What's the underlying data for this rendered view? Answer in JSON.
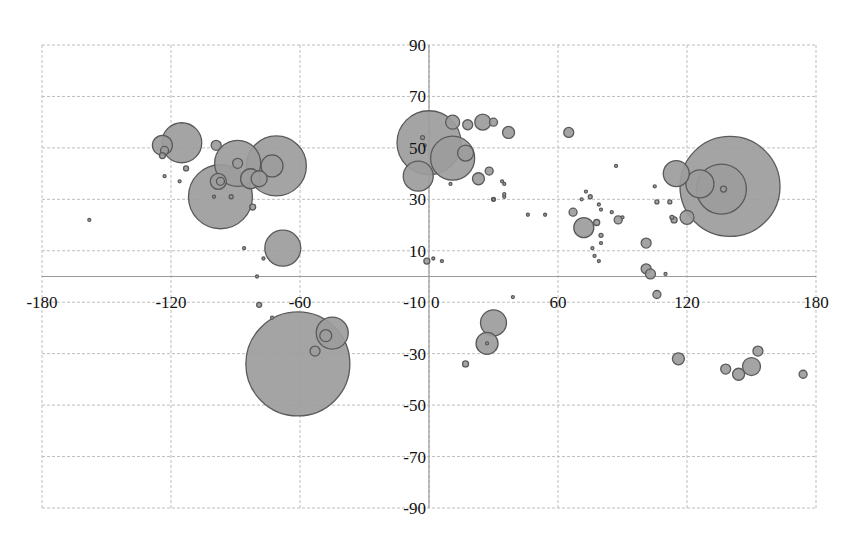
{
  "chart_data": {
    "type": "bubble",
    "title": "",
    "xlabel": "",
    "ylabel": "",
    "xlim": [
      -180,
      180
    ],
    "ylim": [
      -90,
      90
    ],
    "x_ticks": [
      -180,
      -120,
      -60,
      0,
      60,
      120,
      180
    ],
    "y_ticks": [
      90,
      70,
      50,
      30,
      10,
      -10,
      -30,
      -50,
      -70,
      -90
    ],
    "grid": true,
    "legend": null,
    "colors": {
      "bubble_fill": "#9c9c9c",
      "bubble_border": "#5a5a5a",
      "grid": "#bdbdbd"
    },
    "size_unit": "radius_px",
    "points": [
      {
        "x": -158,
        "y": 22,
        "r": 1.5
      },
      {
        "x": -115,
        "y": 52,
        "r": 20
      },
      {
        "x": -124,
        "y": 51,
        "r": 10
      },
      {
        "x": -123,
        "y": 49,
        "r": 4
      },
      {
        "x": -124,
        "y": 47,
        "r": 3
      },
      {
        "x": -123,
        "y": 39,
        "r": 1.5
      },
      {
        "x": -116,
        "y": 37,
        "r": 1.5
      },
      {
        "x": -113,
        "y": 42,
        "r": 2.5
      },
      {
        "x": -99,
        "y": 51,
        "r": 5
      },
      {
        "x": -89,
        "y": 44,
        "r": 23
      },
      {
        "x": -71,
        "y": 43,
        "r": 30
      },
      {
        "x": -97,
        "y": 31,
        "r": 32
      },
      {
        "x": -73,
        "y": 43,
        "r": 11
      },
      {
        "x": -89,
        "y": 44,
        "r": 5
      },
      {
        "x": -83,
        "y": 38,
        "r": 10
      },
      {
        "x": -79,
        "y": 38,
        "r": 8
      },
      {
        "x": -98,
        "y": 37,
        "r": 8
      },
      {
        "x": -97,
        "y": 37,
        "r": 4
      },
      {
        "x": -100,
        "y": 31,
        "r": 1.5
      },
      {
        "x": -92,
        "y": 31,
        "r": 2
      },
      {
        "x": -82,
        "y": 27,
        "r": 3
      },
      {
        "x": -68,
        "y": 11,
        "r": 18
      },
      {
        "x": -86,
        "y": 11,
        "r": 1.5
      },
      {
        "x": -77,
        "y": 7,
        "r": 1.5
      },
      {
        "x": -80,
        "y": 0,
        "r": 1.5
      },
      {
        "x": -79,
        "y": -11,
        "r": 2.5
      },
      {
        "x": -73,
        "y": -16,
        "r": 1.5
      },
      {
        "x": -61,
        "y": -34,
        "r": 52
      },
      {
        "x": -45,
        "y": -22,
        "r": 16
      },
      {
        "x": -48,
        "y": -23,
        "r": 6
      },
      {
        "x": -53,
        "y": -29,
        "r": 5
      },
      {
        "x": 0,
        "y": 52,
        "r": 32
      },
      {
        "x": -5,
        "y": 39,
        "r": 15
      },
      {
        "x": 11,
        "y": 46,
        "r": 22
      },
      {
        "x": 17,
        "y": 48,
        "r": 8
      },
      {
        "x": 11,
        "y": 60,
        "r": 7
      },
      {
        "x": 18,
        "y": 59,
        "r": 5
      },
      {
        "x": 25,
        "y": 60,
        "r": 8
      },
      {
        "x": 30,
        "y": 60,
        "r": 4
      },
      {
        "x": 37,
        "y": 56,
        "r": 6
      },
      {
        "x": 23,
        "y": 38,
        "r": 6
      },
      {
        "x": 28,
        "y": 41,
        "r": 4
      },
      {
        "x": 10,
        "y": 36,
        "r": 1.5
      },
      {
        "x": 35,
        "y": 36,
        "r": 1.5
      },
      {
        "x": 35,
        "y": 31,
        "r": 1.5
      },
      {
        "x": 30,
        "y": 30,
        "r": 2
      },
      {
        "x": -3,
        "y": 54,
        "r": 2
      },
      {
        "x": -2,
        "y": 51,
        "r": 1.5
      },
      {
        "x": -1,
        "y": 6,
        "r": 3
      },
      {
        "x": 2,
        "y": 7,
        "r": 1.5
      },
      {
        "x": 6,
        "y": 6,
        "r": 1.5
      },
      {
        "x": 39,
        "y": -8,
        "r": 1.5
      },
      {
        "x": 30,
        "y": -18,
        "r": 13
      },
      {
        "x": 27,
        "y": -26,
        "r": 11
      },
      {
        "x": 27,
        "y": -26,
        "r": 1.5
      },
      {
        "x": 17,
        "y": -34,
        "r": 3
      },
      {
        "x": 65,
        "y": 56,
        "r": 5
      },
      {
        "x": 87,
        "y": 43,
        "r": 1.5
      },
      {
        "x": 34,
        "y": 37,
        "r": 1.5
      },
      {
        "x": 35,
        "y": 32,
        "r": 1.5
      },
      {
        "x": 30,
        "y": 30,
        "r": 1.5
      },
      {
        "x": 46,
        "y": 24,
        "r": 1.5
      },
      {
        "x": 54,
        "y": 24,
        "r": 1.5
      },
      {
        "x": 67,
        "y": 25,
        "r": 4
      },
      {
        "x": 72,
        "y": 19,
        "r": 10
      },
      {
        "x": 73,
        "y": 33,
        "r": 1.5
      },
      {
        "x": 75,
        "y": 31,
        "r": 2
      },
      {
        "x": 71,
        "y": 30,
        "r": 1.5
      },
      {
        "x": 79,
        "y": 28,
        "r": 1.5
      },
      {
        "x": 80,
        "y": 26,
        "r": 1.5
      },
      {
        "x": 85,
        "y": 25,
        "r": 1.5
      },
      {
        "x": 88,
        "y": 22,
        "r": 4
      },
      {
        "x": 90,
        "y": 23,
        "r": 1.5
      },
      {
        "x": 78,
        "y": 21,
        "r": 3
      },
      {
        "x": 80,
        "y": 16,
        "r": 2
      },
      {
        "x": 80,
        "y": 13,
        "r": 1.5
      },
      {
        "x": 76,
        "y": 11,
        "r": 1.5
      },
      {
        "x": 77,
        "y": 8,
        "r": 1.5
      },
      {
        "x": 79,
        "y": 6,
        "r": 1.5
      },
      {
        "x": 101,
        "y": 13,
        "r": 5
      },
      {
        "x": 101,
        "y": 3,
        "r": 5
      },
      {
        "x": 103,
        "y": 1,
        "r": 5
      },
      {
        "x": 106,
        "y": -7,
        "r": 4
      },
      {
        "x": 110,
        "y": 1,
        "r": 1.5
      },
      {
        "x": 115,
        "y": 40,
        "r": 13
      },
      {
        "x": 140,
        "y": 35,
        "r": 50
      },
      {
        "x": 136,
        "y": 34,
        "r": 25
      },
      {
        "x": 126,
        "y": 36,
        "r": 14
      },
      {
        "x": 137,
        "y": 34,
        "r": 3
      },
      {
        "x": 105,
        "y": 35,
        "r": 1.5
      },
      {
        "x": 106,
        "y": 29,
        "r": 2
      },
      {
        "x": 113,
        "y": 23,
        "r": 2
      },
      {
        "x": 112,
        "y": 29,
        "r": 2
      },
      {
        "x": 120,
        "y": 23,
        "r": 7
      },
      {
        "x": 114,
        "y": 22,
        "r": 3
      },
      {
        "x": 116,
        "y": -32,
        "r": 6
      },
      {
        "x": 138,
        "y": -36,
        "r": 5
      },
      {
        "x": 144,
        "y": -38,
        "r": 6
      },
      {
        "x": 150,
        "y": -35,
        "r": 9
      },
      {
        "x": 153,
        "y": -29,
        "r": 5
      },
      {
        "x": 174,
        "y": -38,
        "r": 4
      }
    ]
  }
}
